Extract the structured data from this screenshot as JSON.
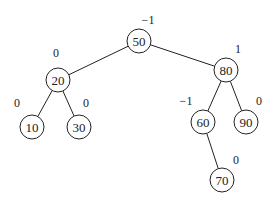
{
  "diagram": {
    "type": "avl-tree",
    "node_radius": 12,
    "nodes": [
      {
        "id": "n50",
        "value": "50",
        "x": 139,
        "y": 41,
        "balance": "−1",
        "bx": 148,
        "by": 20
      },
      {
        "id": "n20",
        "value": "20",
        "x": 58,
        "y": 80,
        "balance": "0",
        "bx": 56,
        "by": 53
      },
      {
        "id": "n80",
        "value": "80",
        "x": 226,
        "y": 70,
        "balance": "1",
        "bx": 238,
        "by": 49
      },
      {
        "id": "n10",
        "value": "10",
        "x": 32,
        "y": 127,
        "balance": "0",
        "bx": 17,
        "by": 103
      },
      {
        "id": "n30",
        "value": "30",
        "x": 79,
        "y": 127,
        "balance": "0",
        "bx": 86,
        "by": 103
      },
      {
        "id": "n60",
        "value": "60",
        "x": 203,
        "y": 122,
        "balance": "−1",
        "bx": 186,
        "by": 101
      },
      {
        "id": "n90",
        "value": "90",
        "x": 246,
        "y": 122,
        "balance": "0",
        "bx": 259,
        "by": 101
      },
      {
        "id": "n70",
        "value": "70",
        "x": 222,
        "y": 180,
        "balance": "0",
        "bx": 236,
        "by": 160
      }
    ],
    "edges": [
      [
        "n50",
        "n20"
      ],
      [
        "n50",
        "n80"
      ],
      [
        "n20",
        "n10"
      ],
      [
        "n20",
        "n30"
      ],
      [
        "n80",
        "n60"
      ],
      [
        "n80",
        "n90"
      ],
      [
        "n60",
        "n70"
      ]
    ]
  }
}
